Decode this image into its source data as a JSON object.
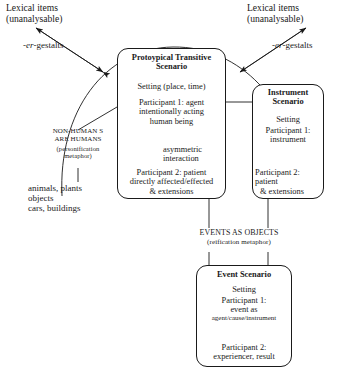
{
  "diagram": {
    "labels": {
      "lexical_left_1": "Lexical items",
      "lexical_left_2": "(unanalysable)",
      "lexical_right_1": "Lexical items",
      "lexical_right_2": "(unanalysable)",
      "gestalts_left_prefix": "-",
      "gestalts_left_italic": "er",
      "gestalts_left_suffix": "-gestalts",
      "gestalts_right_prefix": "-",
      "gestalts_right_italic": "er",
      "gestalts_right_suffix": "-gestalts",
      "metaphor_left_1": "NON-HUMAN S",
      "metaphor_left_2": "ARE HUMANS",
      "metaphor_left_3": "(personification",
      "metaphor_left_4": "metaphor)",
      "examples_1": "animals, plants",
      "examples_2": "objects",
      "examples_3": "cars, buildings",
      "events_objects": "EVENTS AS OBJECTS",
      "reification": "(reification metaphor)",
      "asymmetric_1": "asymmetric",
      "asymmetric_2": "interaction"
    },
    "boxes": {
      "prototypical": {
        "title_1": "Protoypical Transitive",
        "title_2": "Scenario",
        "setting": "Setting (place, time)",
        "participant1_1": "Participant 1: agent",
        "participant1_2": "intentionally acting",
        "participant1_3": "human being",
        "participant2_1": "Participant 2: patient",
        "participant2_2": "directly affected/effected",
        "participant2_3": "& extensions"
      },
      "instrument": {
        "title_1": "Instrument",
        "title_2": "Scenario",
        "setting": "Setting",
        "participant1_1": "Participant 1:",
        "participant1_2": "instrument",
        "participant2_1": "Participant 2:",
        "participant2_2": "patient",
        "participant2_3": "& extensions"
      },
      "event": {
        "title": "Event Scenario",
        "setting": "Setting",
        "participant1_1": "Participant 1:",
        "participant1_2": "event as",
        "participant1_3": "agent/cause/instrument",
        "participant2_1": "Participant 2:",
        "participant2_2": "experiencer, result"
      }
    },
    "colors": {
      "ink": "#1a1a1a",
      "paper": "#ffffff"
    }
  }
}
